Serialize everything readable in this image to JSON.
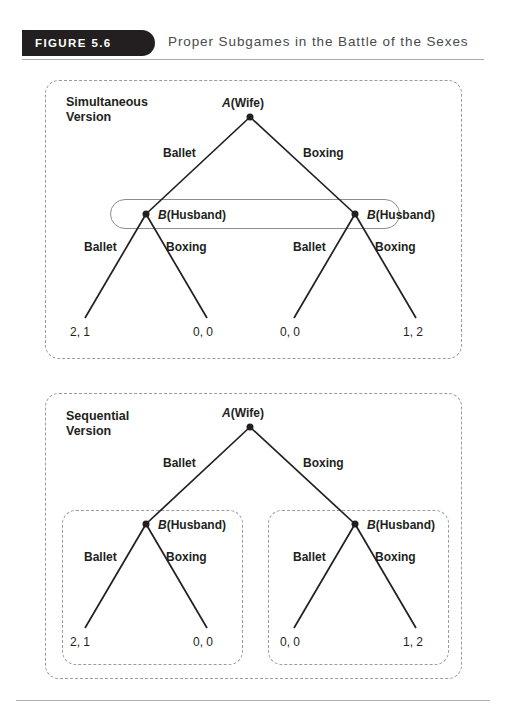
{
  "figure": {
    "badge_label": "FIGURE 5.6",
    "title": "Proper Subgames in the Battle of the Sexes"
  },
  "colors": {
    "badge_background": "#231f20",
    "title_text": "#4a4a4a",
    "ink": "#231f20",
    "dashed_border": "#9b9b9b",
    "info_set_border": "#8d8d8d"
  },
  "panels": [
    {
      "id": "simultaneous",
      "caption": "Simultaneous\nVersion",
      "root": {
        "label_player": "A",
        "label_role": "(Wife)"
      },
      "root_branches": [
        {
          "label": "Ballet"
        },
        {
          "label": "Boxing"
        }
      ],
      "info_set": {
        "present": true,
        "shape": "rounded-oval"
      },
      "second_nodes": [
        {
          "label_player": "B",
          "label_role": "(Husband)"
        },
        {
          "label_player": "B",
          "label_role": "(Husband)"
        }
      ],
      "second_branches": [
        {
          "label": "Ballet"
        },
        {
          "label": "Boxing"
        },
        {
          "label": "Ballet"
        },
        {
          "label": "Boxing"
        }
      ],
      "payoffs": [
        "2, 1",
        "0, 0",
        "0, 0",
        "1, 2"
      ]
    },
    {
      "id": "sequential",
      "caption": "Sequential\nVersion",
      "root": {
        "label_player": "A",
        "label_role": "(Wife)"
      },
      "root_branches": [
        {
          "label": "Ballet"
        },
        {
          "label": "Boxing"
        }
      ],
      "info_set": {
        "present": false
      },
      "second_nodes": [
        {
          "label_player": "B",
          "label_role": "(Husband)"
        },
        {
          "label_player": "B",
          "label_role": "(Husband)"
        }
      ],
      "second_branches": [
        {
          "label": "Ballet"
        },
        {
          "label": "Boxing"
        },
        {
          "label": "Ballet"
        },
        {
          "label": "Boxing"
        }
      ],
      "payoffs": [
        "2, 1",
        "0, 0",
        "0, 0",
        "1, 2"
      ],
      "subgame_boxes": 2
    }
  ]
}
